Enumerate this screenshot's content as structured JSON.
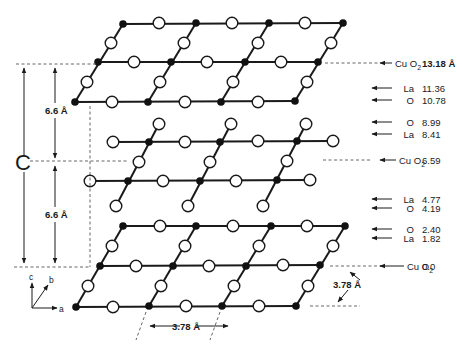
{
  "figure": {
    "c_axis_label": "C",
    "interlayer_spacing_upper": "6.6 Å",
    "interlayer_spacing_lower": "6.6 Å",
    "lattice_constant_a": "3.78 Å",
    "lattice_constant_b": "3.78 Å",
    "axes": {
      "c": "c",
      "b": "b",
      "a": "a"
    }
  },
  "layer_labels": [
    {
      "species": "Cu O",
      "subscript": "2",
      "height": "13.18 Å",
      "y": 63,
      "bold": true,
      "dashed": true
    },
    {
      "species": "La",
      "subscript": "",
      "height": "11.36",
      "y": 88
    },
    {
      "species": "O",
      "subscript": "",
      "height": "10.78",
      "y": 100
    },
    {
      "species": "O",
      "subscript": "",
      "height": "8.99",
      "y": 122
    },
    {
      "species": "La",
      "subscript": "",
      "height": "8.41",
      "y": 134
    },
    {
      "species": "Cu O",
      "subscript": "2",
      "height": "6.59",
      "y": 160,
      "dashed": true
    },
    {
      "species": "La",
      "subscript": "",
      "height": "4.77",
      "y": 199
    },
    {
      "species": "O",
      "subscript": "",
      "height": "4.19",
      "y": 208
    },
    {
      "species": "O",
      "subscript": "",
      "height": "2.40",
      "y": 229
    },
    {
      "species": "La",
      "subscript": "",
      "height": "1.82",
      "y": 238
    },
    {
      "species": "Cu O",
      "subscript": "2",
      "height": "0.0",
      "y": 266,
      "dashed": true
    }
  ],
  "legend": {
    "filled_circle": "Cu",
    "open_circle": "O"
  }
}
